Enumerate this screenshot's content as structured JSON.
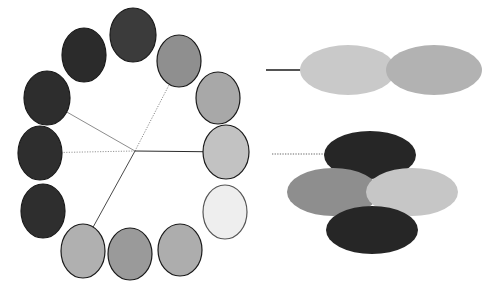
{
  "figure": {
    "title": "",
    "background": "#ffffff",
    "width": 492,
    "height": 295,
    "style": "grayscale ellipse glyph diagram"
  },
  "chart_data": {
    "type": "scatter",
    "title": "",
    "subtitle": "",
    "xlabel": "",
    "ylabel": "",
    "xlim": [
      0,
      492
    ],
    "ylim": [
      0,
      295
    ],
    "grid": false,
    "legend": "none",
    "groups": [
      {
        "name": "ring-cluster",
        "layout": "radial-ring",
        "hub": {
          "x": 135,
          "y": 151,
          "label": ""
        },
        "nodes": [
          {
            "id": "n01",
            "x": 133,
            "y": 35,
            "rx": 23,
            "ry": 27,
            "rot": 0,
            "fill": "#3b3b3b",
            "stroke": "#1a1a1a",
            "connected": false
          },
          {
            "id": "n02",
            "x": 179,
            "y": 61,
            "rx": 22,
            "ry": 26,
            "rot": 0,
            "fill": "#8f8f8f",
            "stroke": "#1a1a1a",
            "connected": true
          },
          {
            "id": "n03",
            "x": 218,
            "y": 98,
            "rx": 22,
            "ry": 26,
            "rot": 0,
            "fill": "#a8a8a8",
            "stroke": "#1a1a1a",
            "connected": false
          },
          {
            "id": "n04",
            "x": 226,
            "y": 152,
            "rx": 23,
            "ry": 27,
            "rot": 0,
            "fill": "#c2c2c2",
            "stroke": "#1a1a1a",
            "connected": true
          },
          {
            "id": "n05",
            "x": 225,
            "y": 212,
            "rx": 22,
            "ry": 27,
            "rot": 0,
            "fill": "#eeeeee",
            "stroke": "#555555",
            "connected": false
          },
          {
            "id": "n06",
            "x": 180,
            "y": 250,
            "rx": 22,
            "ry": 26,
            "rot": 0,
            "fill": "#adadad",
            "stroke": "#1a1a1a",
            "connected": false
          },
          {
            "id": "n07",
            "x": 130,
            "y": 254,
            "rx": 22,
            "ry": 26,
            "rot": 0,
            "fill": "#9a9a9a",
            "stroke": "#1a1a1a",
            "connected": false
          },
          {
            "id": "n08",
            "x": 83,
            "y": 251,
            "rx": 22,
            "ry": 27,
            "rot": 0,
            "fill": "#b0b0b0",
            "stroke": "#1a1a1a",
            "connected": true
          },
          {
            "id": "n09",
            "x": 43,
            "y": 211,
            "rx": 22,
            "ry": 27,
            "rot": 0,
            "fill": "#2e2e2e",
            "stroke": "#1a1a1a",
            "connected": false
          },
          {
            "id": "n10",
            "x": 40,
            "y": 153,
            "rx": 22,
            "ry": 27,
            "rot": 0,
            "fill": "#2e2e2e",
            "stroke": "#1a1a1a",
            "connected": true
          },
          {
            "id": "n11",
            "x": 47,
            "y": 98,
            "rx": 23,
            "ry": 27,
            "rot": 0,
            "fill": "#2d2d2d",
            "stroke": "#1a1a1a",
            "connected": true
          },
          {
            "id": "n12",
            "x": 84,
            "y": 55,
            "rx": 22,
            "ry": 27,
            "rot": 0,
            "fill": "#2b2b2b",
            "stroke": "#1a1a1a",
            "connected": false
          }
        ],
        "edges": [
          {
            "id": "e1",
            "from": "hub",
            "to": "n11",
            "style": "solid",
            "color": "#6f6f6f",
            "width": 0.8
          },
          {
            "id": "e2",
            "from": "hub",
            "to": "n02",
            "style": "dotted",
            "color": "#7d7d7d",
            "width": 0.9
          },
          {
            "id": "e3",
            "from": "hub",
            "to": "n10",
            "style": "dotted",
            "color": "#8a8a8a",
            "width": 0.9
          },
          {
            "id": "e4",
            "from": "hub",
            "to": "n04",
            "style": "solid",
            "color": "#2b2b2b",
            "width": 1.0
          },
          {
            "id": "e5",
            "from": "hub",
            "to": "n08",
            "style": "solid",
            "color": "#4a4a4a",
            "width": 1.0
          }
        ]
      },
      {
        "name": "top-right-pair",
        "layout": "overlapping-horizontal-ellipses",
        "leader": {
          "x1": 266,
          "y1": 70,
          "x2": 307,
          "y2": 70,
          "style": "solid",
          "color": "#1a1a1a",
          "width": 1.4
        },
        "nodes": [
          {
            "id": "t1",
            "x": 348,
            "y": 70,
            "rx": 48,
            "ry": 25,
            "rot": 0,
            "fill": "#c9c9c9",
            "stroke": "none"
          },
          {
            "id": "t2",
            "x": 434,
            "y": 70,
            "rx": 48,
            "ry": 25,
            "rot": 0,
            "fill": "#b2b2b2",
            "stroke": "none"
          }
        ]
      },
      {
        "name": "bottom-right-rosette",
        "layout": "overlapping-horizontal-ellipses",
        "leader": {
          "x1": 272,
          "y1": 154,
          "x2": 325,
          "y2": 154,
          "style": "dotted",
          "color": "#9a9a9a",
          "width": 1.4
        },
        "nodes": [
          {
            "id": "b1",
            "x": 370,
            "y": 155,
            "rx": 46,
            "ry": 24,
            "rot": 0,
            "fill": "#262626",
            "stroke": "none"
          },
          {
            "id": "b2",
            "x": 333,
            "y": 192,
            "rx": 46,
            "ry": 24,
            "rot": 0,
            "fill": "#8e8e8e",
            "stroke": "none"
          },
          {
            "id": "b3",
            "x": 412,
            "y": 192,
            "rx": 46,
            "ry": 24,
            "rot": 0,
            "fill": "#c6c6c6",
            "stroke": "none"
          },
          {
            "id": "b4",
            "x": 372,
            "y": 230,
            "rx": 46,
            "ry": 24,
            "rot": 0,
            "fill": "#262626",
            "stroke": "none"
          }
        ]
      }
    ]
  }
}
